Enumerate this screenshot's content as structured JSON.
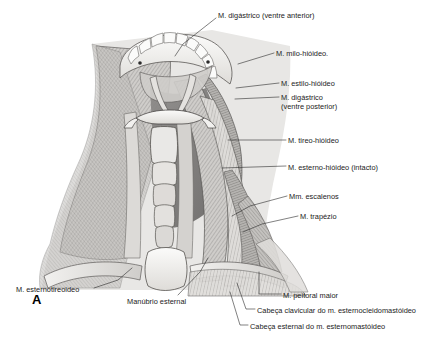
{
  "figure": {
    "letter": "A",
    "language": "pt-BR"
  },
  "labels": [
    {
      "id": "digastrico-anterior",
      "text": "M. digástrico (ventre anterior)",
      "x": 218,
      "y": 11,
      "leader": [
        [
          216,
          18
        ],
        [
          183,
          44
        ],
        [
          175,
          56
        ]
      ]
    },
    {
      "id": "milo-hioideo",
      "text": "M. milo-hióideo.",
      "x": 276,
      "y": 49,
      "leader": [
        [
          274,
          53
        ],
        [
          238,
          64
        ]
      ]
    },
    {
      "id": "estilo-hioideo",
      "text": "M. estilo-hióideo",
      "x": 281,
      "y": 79,
      "leader": [
        [
          279,
          83
        ],
        [
          236,
          88
        ]
      ]
    },
    {
      "id": "digastrico-posterior-l1",
      "text": "M. digástrico",
      "x": 281,
      "y": 93,
      "leader": [
        [
          279,
          97
        ],
        [
          235,
          99
        ]
      ]
    },
    {
      "id": "digastrico-posterior-l2",
      "text": "(ventre posterior)",
      "x": 281,
      "y": 102,
      "leader": []
    },
    {
      "id": "tireo-hioideo",
      "text": "M. tireo-hióideo",
      "x": 288,
      "y": 136,
      "leader": [
        [
          286,
          140
        ],
        [
          228,
          140
        ]
      ]
    },
    {
      "id": "esterno-hioideo",
      "text": "M. esterno-hióideo (intacto)",
      "x": 288,
      "y": 163,
      "leader": [
        [
          286,
          166
        ],
        [
          222,
          168
        ]
      ]
    },
    {
      "id": "escalenos",
      "text": "Mm. escalenos",
      "x": 289,
      "y": 192,
      "leader": [
        [
          287,
          196
        ],
        [
          250,
          206
        ],
        [
          232,
          216
        ]
      ]
    },
    {
      "id": "trapezio",
      "text": "M. trapézio",
      "x": 300,
      "y": 212,
      "leader": [
        [
          298,
          216
        ],
        [
          262,
          224
        ],
        [
          243,
          232
        ]
      ]
    },
    {
      "id": "peitoral-maior",
      "text": "M. peitoral maior",
      "x": 283,
      "y": 291,
      "leader": [
        [
          281,
          294
        ],
        [
          259,
          294
        ],
        [
          259,
          272
        ]
      ]
    },
    {
      "id": "cabeca-clavicular",
      "text": "Cabeça clavicular do m. esternocleidomastóideo",
      "x": 257,
      "y": 306,
      "leader": [
        [
          255,
          309
        ],
        [
          246,
          309
        ],
        [
          237,
          283
        ]
      ]
    },
    {
      "id": "cabeca-esternal",
      "text": "Cabeça esternal do m. esternomastóideo",
      "x": 250,
      "y": 322,
      "leader": [
        [
          248,
          325
        ],
        [
          240,
          325
        ],
        [
          230,
          292
        ]
      ]
    },
    {
      "id": "esternotireoideo",
      "text": "M. esternotireoideo",
      "x": 16,
      "y": 285,
      "leader": [
        [
          94,
          288
        ],
        [
          118,
          280
        ],
        [
          132,
          268
        ]
      ]
    },
    {
      "id": "manubrio-esternal",
      "text": "Manúbrio esternal",
      "x": 127,
      "y": 297,
      "leader": [
        [
          178,
          295
        ],
        [
          200,
          272
        ],
        [
          208,
          258
        ]
      ]
    }
  ],
  "anatomy": {
    "structures": [
      "mandible-with-teeth",
      "hyoid-bone",
      "thyroid-cartilage",
      "trachea-rings",
      "sternocleidomastoid-left",
      "sternocleidomastoid-right",
      "trapezius",
      "scalene-muscles",
      "pectoralis-major",
      "manubrium-sterni",
      "clavicle"
    ],
    "palette": {
      "muscle_light": "#d8d6d3",
      "muscle_mid": "#b9b7b4",
      "muscle_dark": "#8e8c8a",
      "deep_shadow": "#6e6c6b",
      "bone": "#efeeec",
      "outline": "#4a4a4a",
      "label_text": "#1b1b1b"
    }
  }
}
